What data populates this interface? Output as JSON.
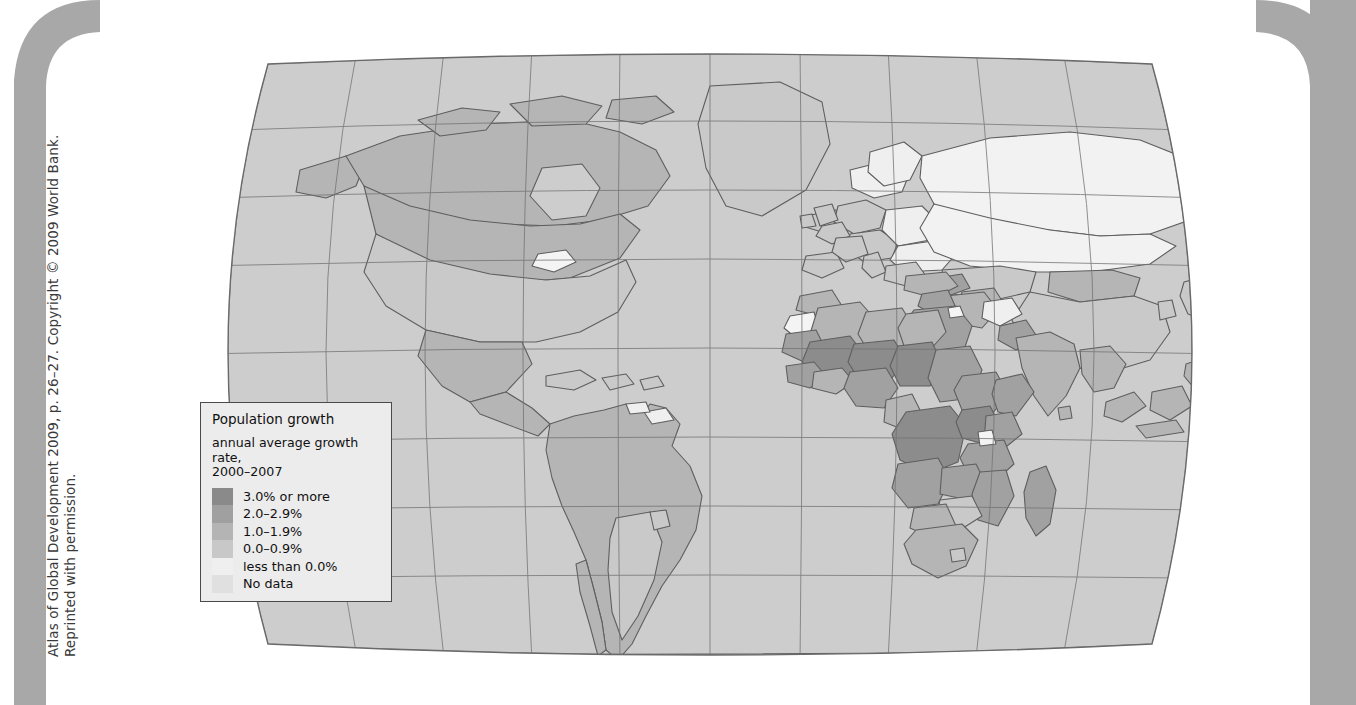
{
  "attribution": {
    "line1": "Atlas of Global Development 2009, p. 26–27. Copyright © 2009 World Bank.",
    "line2": "Reprinted with permission."
  },
  "legend": {
    "title": "Population growth",
    "subtitle_line1": "annual average growth rate,",
    "subtitle_line2": "2000–2007",
    "entries": [
      {
        "label": "3.0% or more",
        "color": "#8a8a8a"
      },
      {
        "label": "2.0–2.9%",
        "color": "#a0a0a0"
      },
      {
        "label": "1.0–1.9%",
        "color": "#b4b4b4"
      },
      {
        "label": "0.0–0.9%",
        "color": "#c8c8c8"
      },
      {
        "label": "less than 0.0%",
        "color": "#efefef"
      },
      {
        "label": "No data",
        "color": "#e0e0e0"
      }
    ]
  },
  "chart_data": {
    "type": "map",
    "title": "Population growth",
    "subtitle": "annual average growth rate, 2000–2007",
    "projection": "Robinson",
    "graticule": {
      "meridian_spacing_deg": 30,
      "parallel_spacing_deg": 20,
      "grid": true
    },
    "color_scale": {
      "kind": "sequential-grayscale",
      "bins": [
        {
          "label": "3.0% or more",
          "min": 3.0,
          "max": null,
          "color": "#8a8a8a"
        },
        {
          "label": "2.0–2.9%",
          "min": 2.0,
          "max": 2.9,
          "color": "#a0a0a0"
        },
        {
          "label": "1.0–1.9%",
          "min": 1.0,
          "max": 1.9,
          "color": "#b4b4b4"
        },
        {
          "label": "0.0–0.9%",
          "min": 0.0,
          "max": 0.9,
          "color": "#c8c8c8"
        },
        {
          "label": "less than 0.0%",
          "min": null,
          "max": 0.0,
          "color": "#efefef"
        },
        {
          "label": "No data",
          "min": null,
          "max": null,
          "color": "#e0e0e0"
        }
      ]
    },
    "ocean_color": "#cfcfcf",
    "border_color": "#5a5a5a",
    "regions": [
      {
        "name": "Canada",
        "bin": "1.0–1.9%"
      },
      {
        "name": "United States",
        "bin": "0.0–0.9%"
      },
      {
        "name": "Greenland",
        "bin": "0.0–0.9%"
      },
      {
        "name": "Mexico",
        "bin": "1.0–1.9%"
      },
      {
        "name": "Central America",
        "bin": "1.0–1.9%"
      },
      {
        "name": "Caribbean",
        "bin": "0.0–0.9%"
      },
      {
        "name": "Brazil",
        "bin": "1.0–1.9%"
      },
      {
        "name": "Argentina",
        "bin": "0.0–0.9%"
      },
      {
        "name": "Chile",
        "bin": "1.0–1.9%"
      },
      {
        "name": "Peru",
        "bin": "1.0–1.9%"
      },
      {
        "name": "Colombia",
        "bin": "1.0–1.9%"
      },
      {
        "name": "Venezuela",
        "bin": "1.0–1.9%"
      },
      {
        "name": "Guyana",
        "bin": "less than 0.0%"
      },
      {
        "name": "Uruguay",
        "bin": "0.0–0.9%"
      },
      {
        "name": "Western Europe",
        "bin": "0.0–0.9%"
      },
      {
        "name": "Eastern Europe",
        "bin": "less than 0.0%"
      },
      {
        "name": "Russian Federation",
        "bin": "less than 0.0%"
      },
      {
        "name": "Ukraine",
        "bin": "less than 0.0%"
      },
      {
        "name": "Kazakhstan",
        "bin": "0.0–0.9%"
      },
      {
        "name": "Mongolia",
        "bin": "1.0–1.9%"
      },
      {
        "name": "China",
        "bin": "0.0–0.9%"
      },
      {
        "name": "Japan",
        "bin": "0.0–0.9%"
      },
      {
        "name": "India",
        "bin": "1.0–1.9%"
      },
      {
        "name": "Pakistan",
        "bin": "2.0–2.9%"
      },
      {
        "name": "Afghanistan",
        "bin": "less than 0.0%"
      },
      {
        "name": "Iran",
        "bin": "1.0–1.9%"
      },
      {
        "name": "Iraq",
        "bin": "2.0–2.9%"
      },
      {
        "name": "Saudi Arabia",
        "bin": "2.0–2.9%"
      },
      {
        "name": "Yemen",
        "bin": "3.0% or more"
      },
      {
        "name": "Turkey",
        "bin": "1.0–1.9%"
      },
      {
        "name": "Kuwait",
        "bin": "less than 0.0%"
      },
      {
        "name": "Egypt",
        "bin": "1.0–1.9%"
      },
      {
        "name": "Libya",
        "bin": "1.0–1.9%"
      },
      {
        "name": "Algeria",
        "bin": "1.0–1.9%"
      },
      {
        "name": "Morocco",
        "bin": "1.0–1.9%"
      },
      {
        "name": "Western Sahara",
        "bin": "less than 0.0%"
      },
      {
        "name": "Mauritania",
        "bin": "2.0–2.9%"
      },
      {
        "name": "Mali",
        "bin": "3.0% or more"
      },
      {
        "name": "Niger",
        "bin": "3.0% or more"
      },
      {
        "name": "Chad",
        "bin": "3.0% or more"
      },
      {
        "name": "Sudan",
        "bin": "2.0–2.9%"
      },
      {
        "name": "Nigeria",
        "bin": "2.0–2.9%"
      },
      {
        "name": "Ethiopia",
        "bin": "2.0–2.9%"
      },
      {
        "name": "Somalia",
        "bin": "2.0–2.9%"
      },
      {
        "name": "Kenya",
        "bin": "2.0–2.9%"
      },
      {
        "name": "Uganda",
        "bin": "3.0% or more"
      },
      {
        "name": "Tanzania",
        "bin": "2.0–2.9%"
      },
      {
        "name": "Dem. Rep. Congo",
        "bin": "3.0% or more"
      },
      {
        "name": "Angola",
        "bin": "2.0–2.9%"
      },
      {
        "name": "Zambia",
        "bin": "2.0–2.9%"
      },
      {
        "name": "Zimbabwe",
        "bin": "0.0–0.9%"
      },
      {
        "name": "South Africa",
        "bin": "1.0–1.9%"
      },
      {
        "name": "Madagascar",
        "bin": "2.0–2.9%"
      },
      {
        "name": "Indonesia",
        "bin": "1.0–1.9%"
      },
      {
        "name": "Papua New Guinea",
        "bin": "2.0–2.9%"
      },
      {
        "name": "Australia",
        "bin": "1.0–1.9%"
      },
      {
        "name": "New Zealand",
        "bin": "1.0–1.9%"
      },
      {
        "name": "Antarctica",
        "bin": "No data"
      }
    ]
  }
}
